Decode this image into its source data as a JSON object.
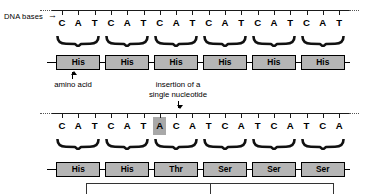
{
  "figure": {
    "side_label": "DNA bases",
    "arrow_glyph": "→",
    "colors": {
      "box_fill": "#b5b5b5",
      "highlight_fill": "#a8a8a8",
      "line": "#000000",
      "background": "#ffffff"
    }
  },
  "normal": {
    "dna_bases": [
      "C",
      "A",
      "T",
      "C",
      "A",
      "T",
      "C",
      "A",
      "T",
      "C",
      "A",
      "T",
      "C",
      "A",
      "T",
      "C",
      "A",
      "T"
    ],
    "protein": [
      "His",
      "His",
      "His",
      "His",
      "His",
      "His"
    ],
    "codon_count": 6
  },
  "mutated": {
    "dna_bases": [
      "C",
      "A",
      "T",
      "C",
      "A",
      "T",
      "A",
      "C",
      "A",
      "T",
      "C",
      "A",
      "T",
      "C",
      "A",
      "T",
      "C",
      "A"
    ],
    "inserted_index": 6,
    "inserted_base": "A",
    "protein": [
      "His",
      "His",
      "Thr",
      "Ser",
      "Ser",
      "Ser"
    ],
    "codon_count": 6
  },
  "annotations": {
    "amino_acid_label": "amino acid",
    "insertion_label_line1": "insertion of a",
    "insertion_label_line2": "single nucleotide"
  }
}
